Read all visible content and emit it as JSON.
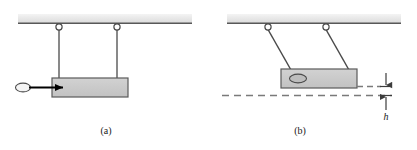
{
  "figure": {
    "background_color": "#ffffff",
    "panels": [
      {
        "id": "a",
        "caption": "(a)",
        "caption_x": 106,
        "caption_y": 134,
        "description": "Bullet moving toward suspended block before impact"
      },
      {
        "id": "b",
        "caption": "(b)",
        "caption_x": 300,
        "caption_y": 134,
        "description": "Block with embedded bullet swung upward by height h"
      }
    ]
  },
  "colors": {
    "ceiling_fill": "#e8e8e8",
    "ceiling_edge": "#585858",
    "block_fill": "#c9c9c9",
    "block_edge": "#5a5a5a",
    "string": "#4a4a4a",
    "bullet_fill": "#f2f2f2",
    "bullet_edge": "#4a4a4a",
    "arrow": "#000000",
    "dashed_line": "#7a7a7a",
    "dimension_line": "#3c3c3c",
    "text": "#1a1a1a"
  },
  "panel_a": {
    "ceiling": {
      "name": "support-ceiling",
      "x": 18,
      "y": 14,
      "width": 174,
      "height": 9
    },
    "pivots": [
      {
        "name": "pivot-left",
        "cx": 59,
        "cy": 27,
        "r": 3.1
      },
      {
        "name": "pivot-right",
        "cx": 117,
        "cy": 27,
        "r": 3.1
      }
    ],
    "strings": [
      {
        "name": "string-left",
        "x1": 59,
        "y1": 30,
        "x2": 59,
        "y2": 78
      },
      {
        "name": "string-right",
        "x1": 117,
        "y1": 30,
        "x2": 117,
        "y2": 78
      }
    ],
    "block": {
      "name": "pendulum-block",
      "x": 52,
      "y": 78,
      "width": 76,
      "height": 19
    },
    "bullet": {
      "name": "bullet-projectile",
      "cx": 23,
      "cy": 87.5,
      "rx": 7.5,
      "ry": 4.5
    },
    "velocity_arrow": {
      "name": "bullet-velocity-arrow",
      "x1": 28,
      "y1": 87.5,
      "x2": 63,
      "y2": 87.5
    }
  },
  "panel_b": {
    "ceiling": {
      "name": "support-ceiling",
      "x": 227,
      "y": 14,
      "width": 174,
      "height": 9
    },
    "pivots": [
      {
        "name": "pivot-left",
        "cx": 268,
        "cy": 27,
        "r": 3.1
      },
      {
        "name": "pivot-right",
        "cx": 326,
        "cy": 27,
        "r": 3.1
      }
    ],
    "strings": [
      {
        "name": "string-left",
        "x1": 268,
        "y1": 30,
        "x2": 291,
        "y2": 69
      },
      {
        "name": "string-right",
        "x1": 326,
        "y1": 30,
        "x2": 349,
        "y2": 69
      }
    ],
    "block": {
      "name": "pendulum-block-raised",
      "x": 281,
      "y": 69,
      "width": 76,
      "height": 19
    },
    "embedded_bullet": {
      "name": "embedded-bullet",
      "cx": 298,
      "cy": 78,
      "rx": 8.5,
      "ry": 4.5
    },
    "dashed_lines": [
      {
        "name": "dashed-line-raised-level",
        "x1": 355,
        "y1": 86,
        "x2": 392,
        "y2": 86
      },
      {
        "name": "dashed-line-initial-level",
        "x1": 222,
        "y1": 95,
        "x2": 392,
        "y2": 95
      }
    ],
    "dimension": {
      "name": "height-dimension-h",
      "label": "h",
      "label_x": 386,
      "label_y": 119,
      "x": 386,
      "tick_top_y": 86,
      "tick_bottom_y": 95,
      "tick_half_width": 6,
      "upper_arrow_from_y": 74,
      "lower_arrow_from_y": 112
    }
  }
}
